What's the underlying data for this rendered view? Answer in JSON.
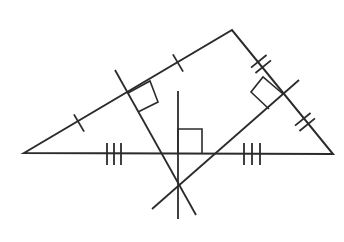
{
  "diagram": {
    "stroke_color": "#2b2b2b",
    "background": "#ffffff",
    "triangle": {
      "vertices": {
        "A": [
          24,
          153
        ],
        "B": [
          232,
          30
        ],
        "C": [
          333,
          154
        ]
      }
    },
    "bisectors": [
      {
        "name": "bisector-side-AB",
        "from": [
          115,
          70
        ],
        "to": [
          196,
          215
        ]
      },
      {
        "name": "bisector-side-BC",
        "from": [
          299,
          80
        ],
        "to": [
          152,
          209
        ]
      },
      {
        "name": "bisector-side-AC",
        "from": [
          178,
          91
        ],
        "to": [
          178,
          219
        ]
      }
    ],
    "circumcenter": [
      178,
      186
    ],
    "right_angle_marks": [
      {
        "name": "right-angle-AB",
        "points": [
          [
            128,
            93
          ],
          [
            150,
            81
          ],
          [
            158,
            102
          ],
          [
            138,
            112
          ]
        ]
      },
      {
        "name": "right-angle-BC",
        "points": [
          [
            283,
            94
          ],
          [
            263,
            77
          ],
          [
            251,
            92
          ],
          [
            269,
            109
          ]
        ]
      },
      {
        "name": "right-angle-AC",
        "points": [
          [
            178,
            153
          ],
          [
            178,
            129
          ],
          [
            202,
            129
          ],
          [
            202,
            153
          ]
        ]
      }
    ],
    "tick_marks": {
      "single": [
        {
          "name": "tick-AB-lower",
          "center": [
            79,
            123
          ]
        },
        {
          "name": "tick-AB-upper",
          "center": [
            178,
            63
          ]
        }
      ],
      "double": [
        {
          "name": "ticks-BC-upper",
          "center": [
            261,
            64
          ]
        },
        {
          "name": "ticks-BC-lower",
          "center": [
            305,
            122
          ]
        }
      ],
      "triple": [
        {
          "name": "ticks-AC-left",
          "xs": [
            107,
            114,
            121
          ],
          "y_top": 143,
          "y_bottom": 165
        },
        {
          "name": "ticks-AC-right",
          "xs": [
            244,
            252,
            260
          ],
          "y_top": 143,
          "y_bottom": 165
        }
      ]
    }
  }
}
